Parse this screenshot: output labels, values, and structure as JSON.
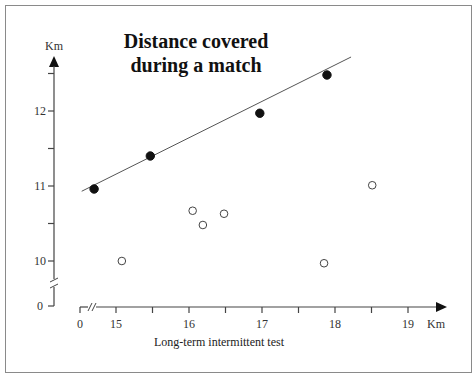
{
  "chart_data": {
    "type": "scatter",
    "title": "Distance covered\nduring a match",
    "title_lines": [
      "Distance covered",
      "during a match"
    ],
    "xlabel": "Long-term intermittent test",
    "x_unit": "Km",
    "ylabel": "",
    "y_unit": "Km",
    "x_ticks": [
      {
        "value": 0,
        "label": "0"
      },
      {
        "value": 15,
        "label": "15"
      },
      {
        "value": 15.5,
        "label": ""
      },
      {
        "value": 16,
        "label": "16"
      },
      {
        "value": 16.5,
        "label": ""
      },
      {
        "value": 17,
        "label": "17"
      },
      {
        "value": 17.5,
        "label": ""
      },
      {
        "value": 18,
        "label": "18"
      },
      {
        "value": 18.5,
        "label": ""
      },
      {
        "value": 19,
        "label": "19"
      }
    ],
    "y_ticks": [
      {
        "value": 0,
        "label": "0"
      },
      {
        "value": 10,
        "label": "10"
      },
      {
        "value": 10.5,
        "label": ""
      },
      {
        "value": 11,
        "label": "11"
      },
      {
        "value": 11.5,
        "label": ""
      },
      {
        "value": 12,
        "label": "12"
      },
      {
        "value": 12.5,
        "label": ""
      }
    ],
    "axis_breaks": {
      "x": "between 0 and 15",
      "y": "between 0 and 10"
    },
    "xlim": [
      14.5,
      19.5
    ],
    "ylim": [
      9.5,
      12.7
    ],
    "grid": false,
    "legend": null,
    "series": [
      {
        "name": "filled",
        "marker": "filled-circle",
        "points": [
          {
            "x": 14.7,
            "y": 10.96
          },
          {
            "x": 15.47,
            "y": 11.4
          },
          {
            "x": 16.97,
            "y": 11.97
          },
          {
            "x": 17.89,
            "y": 12.48
          }
        ]
      },
      {
        "name": "open",
        "marker": "open-circle",
        "points": [
          {
            "x": 15.08,
            "y": 10.0
          },
          {
            "x": 16.05,
            "y": 10.67
          },
          {
            "x": 16.19,
            "y": 10.48
          },
          {
            "x": 16.48,
            "y": 10.63
          },
          {
            "x": 17.85,
            "y": 9.97
          },
          {
            "x": 18.51,
            "y": 11.01
          }
        ]
      }
    ],
    "regression_line": {
      "from": {
        "x": 14.53,
        "y": 10.93
      },
      "to": {
        "x": 18.22,
        "y": 12.72
      },
      "fits_series": "filled"
    }
  },
  "labels": {
    "title_line1": "Distance covered",
    "title_line2": "during a match",
    "y_unit": "Km",
    "x_unit": "Km",
    "x_axis_title": "Long-term intermittent test"
  },
  "colors": {
    "ink": "#111111",
    "axis": "#444444",
    "frame": "#8a8a8a",
    "background": "#ffffff"
  }
}
